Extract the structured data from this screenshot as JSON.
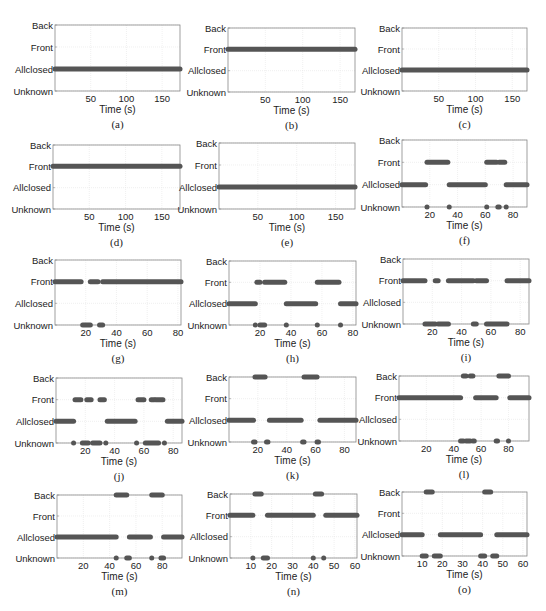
{
  "figure": {
    "state_levels": [
      "Unknown",
      "Allclosed",
      "Front",
      "Back"
    ],
    "xlabel": "Time (s)",
    "marker_color": "#555555",
    "grid_color": "#e6e6e6",
    "axis_color": "#888888"
  },
  "chart_data": [
    {
      "id": "a",
      "caption": "(a)",
      "type": "scatter",
      "title": "",
      "xlabel": "Time (s)",
      "ylabel": "",
      "yticks": [
        "Unknown",
        "Allclosed",
        "Front",
        "Back"
      ],
      "xlim": [
        0,
        175
      ],
      "xticks": [
        50,
        100,
        150
      ],
      "grid": true,
      "segments": [
        {
          "state": "Allclosed",
          "start": 0,
          "end": 175
        }
      ]
    },
    {
      "id": "b",
      "caption": "(b)",
      "type": "scatter",
      "title": "",
      "xlabel": "Time (s)",
      "ylabel": "",
      "yticks": [
        "Unknown",
        "Allclosed",
        "Front",
        "Back"
      ],
      "xlim": [
        0,
        170
      ],
      "xticks": [
        50,
        100,
        150
      ],
      "grid": true,
      "segments": [
        {
          "state": "Front",
          "start": 0,
          "end": 170
        }
      ]
    },
    {
      "id": "c",
      "caption": "(c)",
      "type": "scatter",
      "title": "",
      "xlabel": "Time (s)",
      "ylabel": "",
      "yticks": [
        "Unknown",
        "Allclosed",
        "Front",
        "Back"
      ],
      "xlim": [
        0,
        170
      ],
      "xticks": [
        50,
        100,
        150
      ],
      "grid": true,
      "segments": [
        {
          "state": "Allclosed",
          "start": 0,
          "end": 170
        }
      ]
    },
    {
      "id": "d",
      "caption": "(d)",
      "type": "scatter",
      "title": "",
      "xlabel": "Time (s)",
      "ylabel": "",
      "yticks": [
        "Unknown",
        "Allclosed",
        "Front",
        "Back"
      ],
      "xlim": [
        0,
        175
      ],
      "xticks": [
        50,
        100,
        150
      ],
      "grid": true,
      "segments": [
        {
          "state": "Front",
          "start": 0,
          "end": 175
        }
      ]
    },
    {
      "id": "e",
      "caption": "(e)",
      "type": "scatter",
      "title": "",
      "xlabel": "Time (s)",
      "ylabel": "",
      "yticks": [
        "Unknown",
        "Allclosed",
        "Front",
        "Back"
      ],
      "xlim": [
        0,
        175
      ],
      "xticks": [
        50,
        100,
        150
      ],
      "grid": true,
      "segments": [
        {
          "state": "Allclosed",
          "start": 0,
          "end": 175
        }
      ]
    },
    {
      "id": "f",
      "caption": "(f)",
      "type": "scatter",
      "title": "",
      "xlabel": "Time (s)",
      "ylabel": "",
      "yticks": [
        "Unknown",
        "Allclosed",
        "Front",
        "Back"
      ],
      "xlim": [
        0,
        90
      ],
      "xticks": [
        20,
        40,
        60,
        80
      ],
      "grid": true,
      "segments": [
        {
          "state": "Allclosed",
          "start": 0,
          "end": 17
        },
        {
          "state": "Unknown",
          "start": 18,
          "end": 18
        },
        {
          "state": "Front",
          "start": 18,
          "end": 33
        },
        {
          "state": "Unknown",
          "start": 34,
          "end": 34
        },
        {
          "state": "Allclosed",
          "start": 34,
          "end": 60
        },
        {
          "state": "Unknown",
          "start": 61,
          "end": 61
        },
        {
          "state": "Front",
          "start": 61,
          "end": 68
        },
        {
          "state": "Unknown",
          "start": 69,
          "end": 70
        },
        {
          "state": "Front",
          "start": 70,
          "end": 74
        },
        {
          "state": "Unknown",
          "start": 75,
          "end": 75
        },
        {
          "state": "Allclosed",
          "start": 75,
          "end": 90
        }
      ]
    },
    {
      "id": "g",
      "caption": "(g)",
      "type": "scatter",
      "title": "",
      "xlabel": "Time (s)",
      "ylabel": "",
      "yticks": [
        "Unknown",
        "Allclosed",
        "Front",
        "Back"
      ],
      "xlim": [
        0,
        82
      ],
      "xticks": [
        20,
        40,
        60,
        80
      ],
      "grid": true,
      "segments": [
        {
          "state": "Front",
          "start": 0,
          "end": 17
        },
        {
          "state": "Unknown",
          "start": 18,
          "end": 23
        },
        {
          "state": "Front",
          "start": 23,
          "end": 28
        },
        {
          "state": "Unknown",
          "start": 29,
          "end": 31
        },
        {
          "state": "Front",
          "start": 31,
          "end": 82
        }
      ]
    },
    {
      "id": "h",
      "caption": "(h)",
      "type": "scatter",
      "title": "",
      "xlabel": "Time (s)",
      "ylabel": "",
      "yticks": [
        "Unknown",
        "Allclosed",
        "Front",
        "Back"
      ],
      "xlim": [
        0,
        82
      ],
      "xticks": [
        20,
        40,
        60,
        80
      ],
      "grid": true,
      "segments": [
        {
          "state": "Allclosed",
          "start": 0,
          "end": 17
        },
        {
          "state": "Unknown",
          "start": 17,
          "end": 17
        },
        {
          "state": "Front",
          "start": 18,
          "end": 20
        },
        {
          "state": "Unknown",
          "start": 20,
          "end": 23
        },
        {
          "state": "Front",
          "start": 23,
          "end": 36
        },
        {
          "state": "Unknown",
          "start": 37,
          "end": 37
        },
        {
          "state": "Allclosed",
          "start": 37,
          "end": 56
        },
        {
          "state": "Unknown",
          "start": 57,
          "end": 57
        },
        {
          "state": "Front",
          "start": 57,
          "end": 71
        },
        {
          "state": "Unknown",
          "start": 72,
          "end": 72
        },
        {
          "state": "Allclosed",
          "start": 72,
          "end": 82
        }
      ]
    },
    {
      "id": "i",
      "caption": "(i)",
      "type": "scatter",
      "title": "",
      "xlabel": "Time (s)",
      "ylabel": "",
      "yticks": [
        "Unknown",
        "Allclosed",
        "Front",
        "Back"
      ],
      "xlim": [
        0,
        86
      ],
      "xticks": [
        20,
        40,
        60,
        80
      ],
      "grid": true,
      "segments": [
        {
          "state": "Front",
          "start": 0,
          "end": 15
        },
        {
          "state": "Unknown",
          "start": 15,
          "end": 22
        },
        {
          "state": "Front",
          "start": 22,
          "end": 24
        },
        {
          "state": "Unknown",
          "start": 24,
          "end": 31
        },
        {
          "state": "Front",
          "start": 31,
          "end": 48
        },
        {
          "state": "Unknown",
          "start": 48,
          "end": 50
        },
        {
          "state": "Front",
          "start": 50,
          "end": 57
        },
        {
          "state": "Unknown",
          "start": 57,
          "end": 71
        },
        {
          "state": "Front",
          "start": 71,
          "end": 86
        }
      ]
    },
    {
      "id": "j",
      "caption": "(j)",
      "type": "scatter",
      "title": "",
      "xlabel": "Time (s)",
      "ylabel": "",
      "yticks": [
        "Unknown",
        "Allclosed",
        "Front",
        "Back"
      ],
      "xlim": [
        0,
        86
      ],
      "xticks": [
        20,
        40,
        60,
        80
      ],
      "grid": true,
      "segments": [
        {
          "state": "Allclosed",
          "start": 0,
          "end": 12
        },
        {
          "state": "Unknown",
          "start": 12,
          "end": 12
        },
        {
          "state": "Front",
          "start": 13,
          "end": 17
        },
        {
          "state": "Unknown",
          "start": 18,
          "end": 22
        },
        {
          "state": "Front",
          "start": 21,
          "end": 24
        },
        {
          "state": "Unknown",
          "start": 25,
          "end": 30
        },
        {
          "state": "Front",
          "start": 30,
          "end": 33
        },
        {
          "state": "Unknown",
          "start": 34,
          "end": 34
        },
        {
          "state": "Allclosed",
          "start": 35,
          "end": 54
        },
        {
          "state": "Unknown",
          "start": 55,
          "end": 55
        },
        {
          "state": "Front",
          "start": 56,
          "end": 60
        },
        {
          "state": "Unknown",
          "start": 61,
          "end": 70
        },
        {
          "state": "Front",
          "start": 65,
          "end": 67
        },
        {
          "state": "Front",
          "start": 68,
          "end": 73
        },
        {
          "state": "Unknown",
          "start": 74,
          "end": 74
        },
        {
          "state": "Allclosed",
          "start": 76,
          "end": 86
        }
      ]
    },
    {
      "id": "k",
      "caption": "(k)",
      "type": "scatter",
      "title": "",
      "xlabel": "Time (s)",
      "ylabel": "",
      "yticks": [
        "Unknown",
        "Allclosed",
        "Front",
        "Back"
      ],
      "xlim": [
        0,
        88
      ],
      "xticks": [
        20,
        40,
        60,
        80
      ],
      "grid": true,
      "segments": [
        {
          "state": "Allclosed",
          "start": 0,
          "end": 17
        },
        {
          "state": "Unknown",
          "start": 17,
          "end": 18
        },
        {
          "state": "Back",
          "start": 18,
          "end": 25
        },
        {
          "state": "Unknown",
          "start": 26,
          "end": 27
        },
        {
          "state": "Allclosed",
          "start": 28,
          "end": 50
        },
        {
          "state": "Unknown",
          "start": 51,
          "end": 52
        },
        {
          "state": "Back",
          "start": 52,
          "end": 61
        },
        {
          "state": "Unknown",
          "start": 61,
          "end": 62
        },
        {
          "state": "Allclosed",
          "start": 63,
          "end": 88
        }
      ]
    },
    {
      "id": "l",
      "caption": "(l)",
      "type": "scatter",
      "title": "",
      "xlabel": "Time (s)",
      "ylabel": "",
      "yticks": [
        "Unknown",
        "Allclosed",
        "Front",
        "Back"
      ],
      "xlim": [
        0,
        95
      ],
      "xticks": [
        20,
        40,
        60,
        80
      ],
      "grid": true,
      "segments": [
        {
          "state": "Front",
          "start": 0,
          "end": 45
        },
        {
          "state": "Unknown",
          "start": 45,
          "end": 47
        },
        {
          "state": "Back",
          "start": 47,
          "end": 49
        },
        {
          "state": "Unknown",
          "start": 49,
          "end": 52
        },
        {
          "state": "Back",
          "start": 52,
          "end": 54
        },
        {
          "state": "Unknown",
          "start": 54,
          "end": 55
        },
        {
          "state": "Front",
          "start": 56,
          "end": 71
        },
        {
          "state": "Unknown",
          "start": 71,
          "end": 72
        },
        {
          "state": "Back",
          "start": 73,
          "end": 80
        },
        {
          "state": "Unknown",
          "start": 80,
          "end": 80
        },
        {
          "state": "Front",
          "start": 81,
          "end": 95
        }
      ]
    },
    {
      "id": "m",
      "caption": "(m)",
      "type": "scatter",
      "title": "",
      "xlabel": "Time (s)",
      "ylabel": "",
      "yticks": [
        "Unknown",
        "Allclosed",
        "Front",
        "Back"
      ],
      "xlim": [
        0,
        95
      ],
      "xticks": [
        20,
        40,
        60,
        80
      ],
      "grid": true,
      "segments": [
        {
          "state": "Allclosed",
          "start": 0,
          "end": 45
        },
        {
          "state": "Unknown",
          "start": 45,
          "end": 45
        },
        {
          "state": "Back",
          "start": 45,
          "end": 53
        },
        {
          "state": "Unknown",
          "start": 53,
          "end": 55
        },
        {
          "state": "Allclosed",
          "start": 55,
          "end": 71
        },
        {
          "state": "Unknown",
          "start": 72,
          "end": 72
        },
        {
          "state": "Back",
          "start": 72,
          "end": 80
        },
        {
          "state": "Unknown",
          "start": 79,
          "end": 81
        },
        {
          "state": "Allclosed",
          "start": 81,
          "end": 95
        }
      ]
    },
    {
      "id": "n",
      "caption": "(n)",
      "type": "scatter",
      "title": "",
      "xlabel": "Time (s)",
      "ylabel": "",
      "yticks": [
        "Unknown",
        "Allclosed",
        "Front",
        "Back"
      ],
      "xlim": [
        0,
        61
      ],
      "xticks": [
        10,
        20,
        30,
        40,
        50,
        60
      ],
      "grid": true,
      "segments": [
        {
          "state": "Front",
          "start": 0,
          "end": 11
        },
        {
          "state": "Unknown",
          "start": 11,
          "end": 11
        },
        {
          "state": "Back",
          "start": 12,
          "end": 15
        },
        {
          "state": "Unknown",
          "start": 16,
          "end": 18
        },
        {
          "state": "Front",
          "start": 18,
          "end": 40
        },
        {
          "state": "Unknown",
          "start": 40,
          "end": 40
        },
        {
          "state": "Back",
          "start": 41,
          "end": 44
        },
        {
          "state": "Unknown",
          "start": 45,
          "end": 45
        },
        {
          "state": "Front",
          "start": 46,
          "end": 61
        }
      ]
    },
    {
      "id": "o",
      "caption": "(o)",
      "type": "scatter",
      "title": "",
      "xlabel": "Time (s)",
      "ylabel": "",
      "yticks": [
        "Unknown",
        "Allclosed",
        "Front",
        "Back"
      ],
      "xlim": [
        0,
        62
      ],
      "xticks": [
        10,
        20,
        30,
        40,
        50,
        60
      ],
      "grid": true,
      "segments": [
        {
          "state": "Allclosed",
          "start": 0,
          "end": 10
        },
        {
          "state": "Unknown",
          "start": 10,
          "end": 12
        },
        {
          "state": "Back",
          "start": 12,
          "end": 15
        },
        {
          "state": "Unknown",
          "start": 16,
          "end": 19
        },
        {
          "state": "Allclosed",
          "start": 19,
          "end": 39
        },
        {
          "state": "Unknown",
          "start": 39,
          "end": 41
        },
        {
          "state": "Back",
          "start": 41,
          "end": 44
        },
        {
          "state": "Unknown",
          "start": 45,
          "end": 47
        },
        {
          "state": "Allclosed",
          "start": 47,
          "end": 62
        }
      ]
    }
  ],
  "layout": {
    "panels": [
      {
        "left": 55,
        "top": 25,
        "width": 125,
        "height": 66
      },
      {
        "left": 228,
        "top": 28,
        "width": 127,
        "height": 64
      },
      {
        "left": 402,
        "top": 28,
        "width": 125,
        "height": 63
      },
      {
        "left": 53,
        "top": 145,
        "width": 127,
        "height": 64
      },
      {
        "left": 219,
        "top": 143,
        "width": 136,
        "height": 66
      },
      {
        "left": 402,
        "top": 140,
        "width": 125,
        "height": 67
      },
      {
        "left": 55,
        "top": 260,
        "width": 126,
        "height": 65
      },
      {
        "left": 229,
        "top": 261,
        "width": 127,
        "height": 64
      },
      {
        "left": 403,
        "top": 259,
        "width": 126,
        "height": 65
      },
      {
        "left": 56,
        "top": 378,
        "width": 126,
        "height": 65
      },
      {
        "left": 229,
        "top": 377,
        "width": 127,
        "height": 65
      },
      {
        "left": 399,
        "top": 376,
        "width": 130,
        "height": 65
      },
      {
        "left": 57,
        "top": 495,
        "width": 125,
        "height": 63
      },
      {
        "left": 230,
        "top": 494,
        "width": 127,
        "height": 64
      },
      {
        "left": 402,
        "top": 492,
        "width": 125,
        "height": 64
      }
    ]
  }
}
